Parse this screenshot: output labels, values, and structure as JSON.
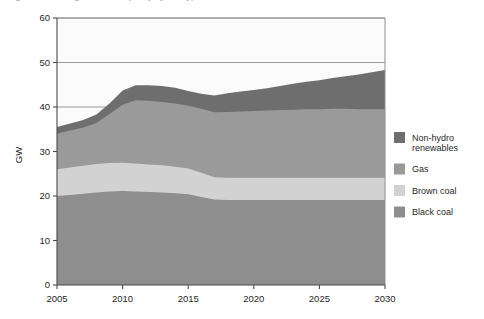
{
  "figure": {
    "cut_off_title": "Figure: Installed generation capacity by fuel type"
  },
  "axis_titles": {
    "y": "GW",
    "x": ""
  },
  "legend": {
    "position": "right",
    "items": [
      {
        "label_line1": "Non-hydro",
        "label_line2": "renewables",
        "name": "non-hydro-renewables",
        "color": "#6e6e6e"
      },
      {
        "label_line1": "Gas",
        "label_line2": "",
        "name": "gas",
        "color": "#9a9a9a"
      },
      {
        "label_line1": "Brown coal",
        "label_line2": "",
        "name": "brown-coal",
        "color": "#d2d2d2"
      },
      {
        "label_line1": "Black coal",
        "label_line2": "",
        "name": "black-coal",
        "color": "#8e8e8e"
      }
    ]
  },
  "colors": {
    "non_hydro_renewables": "#6e6e6e",
    "gas": "#9a9a9a",
    "brown_coal": "#d2d2d2",
    "black_coal": "#8e8e8e",
    "grid": "#8f8f8f",
    "axis": "#4a4a4a",
    "plot_background": "#fbfbfb",
    "text": "#1f1f1f"
  },
  "chart_data": {
    "type": "area",
    "stacked": true,
    "title": "",
    "xlabel": "",
    "ylabel": "GW",
    "xlim": [
      2005,
      2030
    ],
    "ylim": [
      0,
      60
    ],
    "yticks": [
      0,
      10,
      20,
      30,
      40,
      50,
      60
    ],
    "ytick_labels": [
      "0",
      "10",
      "20",
      "30",
      "40",
      "50",
      "60"
    ],
    "xticks": [
      2005,
      2010,
      2015,
      2020,
      2025,
      2030
    ],
    "xtick_labels": [
      "2005",
      "2010",
      "2015",
      "2020",
      "2025",
      "2030"
    ],
    "grid": "horizontal",
    "legend_position": "right",
    "x": [
      2005,
      2006,
      2007,
      2008,
      2009,
      2010,
      2011,
      2012,
      2013,
      2014,
      2015,
      2016,
      2017,
      2018,
      2019,
      2020,
      2021,
      2022,
      2023,
      2024,
      2025,
      2026,
      2027,
      2028,
      2029,
      2030
    ],
    "series": [
      {
        "name": "Black coal",
        "values": [
          20.0,
          20.2,
          20.5,
          20.8,
          21.0,
          21.1,
          21.0,
          20.9,
          20.8,
          20.6,
          20.4,
          19.8,
          19.2,
          19.1,
          19.1,
          19.1,
          19.1,
          19.1,
          19.1,
          19.1,
          19.1,
          19.1,
          19.1,
          19.1,
          19.1,
          19.1
        ]
      },
      {
        "name": "Brown coal",
        "values": [
          6.0,
          6.2,
          6.3,
          6.4,
          6.4,
          6.4,
          6.3,
          6.2,
          6.1,
          6.0,
          5.8,
          5.4,
          5.0,
          5.0,
          5.0,
          5.0,
          5.0,
          5.0,
          5.0,
          5.0,
          5.0,
          5.0,
          5.0,
          5.0,
          5.0,
          5.0
        ]
      },
      {
        "name": "Gas",
        "values": [
          8.0,
          8.3,
          8.6,
          9.2,
          11.0,
          13.0,
          14.2,
          14.3,
          14.2,
          14.2,
          14.1,
          14.4,
          14.6,
          14.8,
          14.9,
          15.0,
          15.1,
          15.2,
          15.3,
          15.4,
          15.4,
          15.5,
          15.5,
          15.4,
          15.4,
          15.4
        ]
      },
      {
        "name": "Non-hydro renewables",
        "values": [
          1.5,
          1.6,
          1.7,
          1.9,
          2.4,
          3.2,
          3.4,
          3.5,
          3.6,
          3.5,
          3.3,
          3.4,
          3.8,
          4.2,
          4.5,
          4.7,
          5.0,
          5.4,
          5.8,
          6.2,
          6.5,
          6.9,
          7.3,
          7.8,
          8.3,
          8.8
        ]
      }
    ],
    "stack_tops": {
      "black_coal": [
        20.0,
        20.2,
        20.5,
        20.8,
        21.0,
        21.1,
        21.0,
        20.9,
        20.8,
        20.6,
        20.4,
        19.8,
        19.2,
        19.1,
        19.1,
        19.1,
        19.1,
        19.1,
        19.1,
        19.1,
        19.1,
        19.1,
        19.1,
        19.1,
        19.1,
        19.1
      ],
      "brown_coal": [
        26.0,
        26.4,
        26.8,
        27.2,
        27.4,
        27.5,
        27.3,
        27.1,
        26.9,
        26.6,
        26.2,
        25.2,
        24.2,
        24.1,
        24.1,
        24.1,
        24.1,
        24.1,
        24.1,
        24.1,
        24.1,
        24.1,
        24.1,
        24.1,
        24.1,
        24.1
      ],
      "gas": [
        34.0,
        34.7,
        35.4,
        36.4,
        38.4,
        40.5,
        41.5,
        41.4,
        41.1,
        40.8,
        40.3,
        39.6,
        38.8,
        38.9,
        39.0,
        39.1,
        39.2,
        39.3,
        39.4,
        39.5,
        39.5,
        39.6,
        39.6,
        39.5,
        39.5,
        39.5
      ],
      "total": [
        35.5,
        36.3,
        37.1,
        38.3,
        40.8,
        43.7,
        44.9,
        44.9,
        44.7,
        44.3,
        43.6,
        43.0,
        42.6,
        43.1,
        43.5,
        43.8,
        44.2,
        44.7,
        45.2,
        45.7,
        46.0,
        46.5,
        46.9,
        47.3,
        47.8,
        48.3
      ]
    }
  }
}
